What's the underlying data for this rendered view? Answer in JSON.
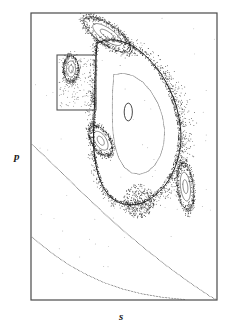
{
  "figure": {
    "name": "poincare-surface-of-section",
    "background_color": "#ffffff",
    "frame": {
      "x": 31,
      "y": 13,
      "width": 186,
      "height": 287,
      "stroke_color": "#4a4a4a",
      "stroke_width": 1.2
    },
    "axes": {
      "x_label": "s",
      "y_label": "p"
    },
    "inset_box": {
      "name": "zoom-region-box",
      "x": 57,
      "y": 55,
      "width": 39,
      "height": 55,
      "stroke_color": "#555555",
      "stroke_width": 1.1
    }
  },
  "chart_data": {
    "type": "scatter",
    "title": "",
    "subtitle": "",
    "xlabel": "s",
    "ylabel": "p",
    "xlim": [
      0,
      1
    ],
    "ylim": [
      0,
      1
    ],
    "grid": false,
    "legend": null,
    "annotations": [
      {
        "name": "magnification-box",
        "kind": "rectangle",
        "x": 0.14,
        "y": 0.84,
        "w": 0.21,
        "h": 0.19,
        "note": "rectangular region marked for magnification"
      }
    ],
    "series": [
      {
        "name": "outer-invariant-curve",
        "style": "solid-line",
        "color": "#1b1b1b",
        "points": [
          [
            0.355,
            0.895
          ],
          [
            0.4,
            0.905
          ],
          [
            0.46,
            0.905
          ],
          [
            0.525,
            0.892
          ],
          [
            0.585,
            0.868
          ],
          [
            0.645,
            0.832
          ],
          [
            0.7,
            0.787
          ],
          [
            0.745,
            0.735
          ],
          [
            0.78,
            0.678
          ],
          [
            0.8,
            0.618
          ],
          [
            0.806,
            0.56
          ],
          [
            0.795,
            0.505
          ],
          [
            0.77,
            0.455
          ],
          [
            0.735,
            0.412
          ],
          [
            0.69,
            0.378
          ],
          [
            0.64,
            0.352
          ],
          [
            0.585,
            0.336
          ],
          [
            0.528,
            0.332
          ],
          [
            0.472,
            0.34
          ],
          [
            0.423,
            0.362
          ],
          [
            0.385,
            0.398
          ],
          [
            0.358,
            0.445
          ],
          [
            0.342,
            0.5
          ],
          [
            0.336,
            0.56
          ],
          [
            0.338,
            0.625
          ],
          [
            0.342,
            0.69
          ],
          [
            0.344,
            0.755
          ],
          [
            0.348,
            0.83
          ],
          [
            0.355,
            0.895
          ]
        ]
      },
      {
        "name": "middle-invariant-curve",
        "style": "dotted-line",
        "color": "#2a2a2a",
        "points": [
          [
            0.445,
            0.785
          ],
          [
            0.495,
            0.79
          ],
          [
            0.548,
            0.782
          ],
          [
            0.6,
            0.76
          ],
          [
            0.645,
            0.727
          ],
          [
            0.682,
            0.686
          ],
          [
            0.707,
            0.64
          ],
          [
            0.718,
            0.592
          ],
          [
            0.714,
            0.545
          ],
          [
            0.696,
            0.503
          ],
          [
            0.666,
            0.47
          ],
          [
            0.628,
            0.448
          ],
          [
            0.585,
            0.438
          ],
          [
            0.541,
            0.443
          ],
          [
            0.502,
            0.462
          ],
          [
            0.472,
            0.494
          ],
          [
            0.452,
            0.535
          ],
          [
            0.441,
            0.583
          ],
          [
            0.437,
            0.635
          ],
          [
            0.437,
            0.69
          ],
          [
            0.44,
            0.74
          ],
          [
            0.445,
            0.785
          ]
        ]
      },
      {
        "name": "central-fixed-point-ellipse",
        "style": "solid-ellipse",
        "color": "#1b1b1b",
        "center": [
          0.523,
          0.655
        ],
        "rx": 0.022,
        "ry": 0.031
      },
      {
        "name": "kam-curve-outer",
        "style": "dotted-line",
        "color": "#2a2a2a",
        "points": [
          [
            0.0,
            0.545
          ],
          [
            0.075,
            0.5
          ],
          [
            0.155,
            0.45
          ],
          [
            0.24,
            0.396
          ],
          [
            0.33,
            0.34
          ],
          [
            0.425,
            0.283
          ],
          [
            0.525,
            0.226
          ],
          [
            0.63,
            0.17
          ],
          [
            0.74,
            0.114
          ],
          [
            0.855,
            0.06
          ],
          [
            0.96,
            0.014
          ],
          [
            1.0,
            0.0
          ]
        ]
      },
      {
        "name": "kam-curve-inner",
        "style": "dotted-line",
        "color": "#2a2a2a",
        "points": [
          [
            0.0,
            0.222
          ],
          [
            0.06,
            0.19
          ],
          [
            0.13,
            0.155
          ],
          [
            0.21,
            0.12
          ],
          [
            0.3,
            0.088
          ],
          [
            0.395,
            0.06
          ],
          [
            0.495,
            0.038
          ],
          [
            0.6,
            0.021
          ],
          [
            0.7,
            0.01
          ],
          [
            0.79,
            0.004
          ],
          [
            0.87,
            0.0
          ]
        ]
      },
      {
        "name": "secondary-island-top",
        "style": "island-chain",
        "color": "#141414",
        "center": [
          0.41,
          0.925
        ],
        "rx": 0.135,
        "ry": 0.038,
        "rotation_deg": -22
      },
      {
        "name": "secondary-island-left",
        "style": "island-chain",
        "color": "#141414",
        "center": [
          0.375,
          0.555
        ],
        "rx": 0.072,
        "ry": 0.04,
        "rotation_deg": -35
      },
      {
        "name": "secondary-island-right",
        "style": "island-chain",
        "color": "#141414",
        "center": [
          0.83,
          0.395
        ],
        "rx": 0.042,
        "ry": 0.082,
        "rotation_deg": 12
      },
      {
        "name": "secondary-island-inset",
        "style": "island-chain",
        "color": "#141414",
        "center": [
          0.215,
          0.805
        ],
        "rx": 0.04,
        "ry": 0.045,
        "rotation_deg": 0
      },
      {
        "name": "chaotic-layer-points",
        "style": "scatter-dense",
        "color": "#101010",
        "point_count": 2400
      },
      {
        "name": "sparse-background-points",
        "style": "scatter-sparse",
        "color": "#6a6a6a",
        "point_count": 70
      }
    ]
  }
}
